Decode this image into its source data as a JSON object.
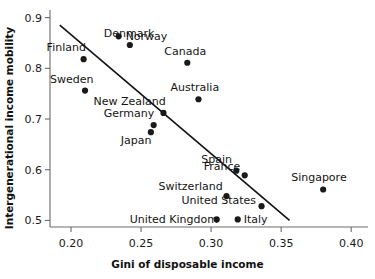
{
  "chart_data": {
    "type": "scatter",
    "title": "",
    "xlabel": "Gini of disposable income",
    "ylabel": "Intergenerational income mobility",
    "xlim": [
      0.185,
      0.412
    ],
    "ylim": [
      0.487,
      0.915
    ],
    "xticks": [
      "0.20",
      "0.25",
      "0.30",
      "0.35",
      "0.40"
    ],
    "xtick_values": [
      0.2,
      0.25,
      0.3,
      0.35,
      0.4
    ],
    "yticks": [
      "0.5",
      "0.6",
      "0.7",
      "0.8",
      "0.9"
    ],
    "ytick_values": [
      0.5,
      0.6,
      0.7,
      0.8,
      0.9
    ],
    "grid": false,
    "legend": "none",
    "point_color": "#1a1a1a",
    "line_color": "#111111",
    "points": [
      {
        "label": "Denmark",
        "x": 0.242,
        "y": 0.846,
        "lx": -26,
        "ly": -8
      },
      {
        "label": "Norway",
        "x": 0.234,
        "y": 0.863,
        "lx": 7,
        "ly": 4
      },
      {
        "label": "Finland",
        "x": 0.209,
        "y": 0.818,
        "lx": -37,
        "ly": -8
      },
      {
        "label": "Canada",
        "x": 0.283,
        "y": 0.811,
        "lx": -23,
        "ly": -8
      },
      {
        "label": "Sweden",
        "x": 0.21,
        "y": 0.756,
        "lx": -35,
        "ly": -8
      },
      {
        "label": "Australia",
        "x": 0.291,
        "y": 0.739,
        "lx": -28,
        "ly": -8
      },
      {
        "label": "New Zealand",
        "x": 0.266,
        "y": 0.712,
        "lx": -70,
        "ly": -8
      },
      {
        "label": "Germany",
        "x": 0.259,
        "y": 0.688,
        "lx": -50,
        "ly": -8
      },
      {
        "label": "Japan",
        "x": 0.257,
        "y": 0.674,
        "lx": -30,
        "ly": 12
      },
      {
        "label": "Spain",
        "x": 0.318,
        "y": 0.598,
        "lx": -35,
        "ly": -8
      },
      {
        "label": "France",
        "x": 0.324,
        "y": 0.589,
        "lx": -41,
        "ly": -5
      },
      {
        "label": "Singapore",
        "x": 0.38,
        "y": 0.561,
        "lx": -32,
        "ly": -8
      },
      {
        "label": "Switzerland",
        "x": 0.311,
        "y": 0.548,
        "lx": -68,
        "ly": -6
      },
      {
        "label": "United States",
        "x": 0.336,
        "y": 0.528,
        "lx": -80,
        "ly": -2
      },
      {
        "label": "United Kingdom",
        "x": 0.304,
        "y": 0.502,
        "lx": -87,
        "ly": 4
      },
      {
        "label": "Italy",
        "x": 0.319,
        "y": 0.502,
        "lx": 6,
        "ly": 4
      }
    ],
    "trend_line": {
      "x0": 0.192,
      "y0": 0.885,
      "x1": 0.356,
      "y1": 0.5
    }
  }
}
